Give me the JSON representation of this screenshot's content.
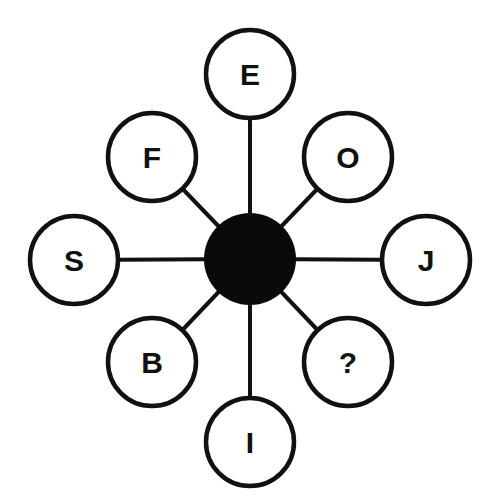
{
  "diagram": {
    "colors": {
      "background": "#ffffff",
      "stroke": "#111111",
      "hub_fill": "#0a0a0a",
      "node_fill": "#ffffff"
    },
    "hub": {
      "cx": 250,
      "cy": 259,
      "r": 46
    },
    "node_radius": 44,
    "nodes": [
      {
        "id": "top",
        "label": "E",
        "cx": 250,
        "cy": 74
      },
      {
        "id": "top-left",
        "label": "F",
        "cx": 152,
        "cy": 157
      },
      {
        "id": "top-right",
        "label": "O",
        "cx": 348,
        "cy": 157
      },
      {
        "id": "left",
        "label": "S",
        "cx": 74,
        "cy": 260
      },
      {
        "id": "right",
        "label": "J",
        "cx": 426,
        "cy": 260
      },
      {
        "id": "bottom-left",
        "label": "B",
        "cx": 152,
        "cy": 362
      },
      {
        "id": "bottom-right",
        "label": "?",
        "cx": 348,
        "cy": 362
      },
      {
        "id": "bottom",
        "label": "I",
        "cx": 250,
        "cy": 442
      }
    ]
  }
}
